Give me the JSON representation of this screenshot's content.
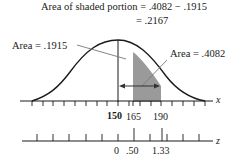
{
  "title_line1": "Area of shaded portion = .4082 − .1915",
  "title_line2": "= .2167",
  "left_area_label": "Area = .1915",
  "right_area_label": "Area = .4082",
  "x_axis": {
    "label": "x",
    "mean_label": "150",
    "tick_labels": [
      "150",
      "165",
      "190"
    ]
  },
  "z_axis": {
    "label": "z",
    "tick_labels": [
      "0",
      ".50",
      "1.33"
    ]
  },
  "colors": {
    "shade": "#9a9a9a",
    "curve": "#1a1a1a",
    "leader": "#777777"
  }
}
